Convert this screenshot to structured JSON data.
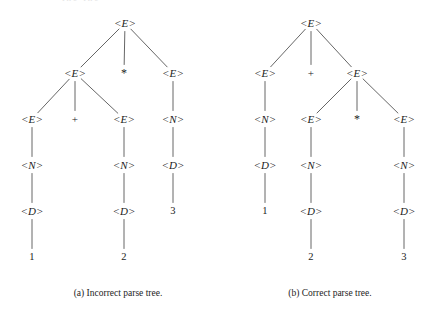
{
  "figure": {
    "width": 437,
    "height": 309,
    "background": "#ffffff",
    "ink_color": "#1c1c1c",
    "edge_color": "#555555",
    "partial_top_text": "the the"
  },
  "trees": [
    {
      "id": "incorrect-parse-tree",
      "caption": "(a) Incorrect parse tree.",
      "caption_x": 118,
      "caption_y": 288,
      "nodes": [
        {
          "id": "a-root",
          "label": "<E>",
          "kind": "nonterminal",
          "x": 125,
          "y": 23,
          "row": 0
        },
        {
          "id": "a-e1",
          "label": "<E>",
          "kind": "nonterminal",
          "x": 75,
          "y": 73,
          "row": 1
        },
        {
          "id": "a-star",
          "label": "*",
          "kind": "operator",
          "x": 124,
          "y": 73,
          "row": 1
        },
        {
          "id": "a-e2",
          "label": "<E>",
          "kind": "nonterminal",
          "x": 173,
          "y": 73,
          "row": 1
        },
        {
          "id": "a-e3",
          "label": "<E>",
          "kind": "nonterminal",
          "x": 32,
          "y": 119,
          "row": 2
        },
        {
          "id": "a-plus",
          "label": "+",
          "kind": "operator",
          "x": 75,
          "y": 119,
          "row": 2
        },
        {
          "id": "a-e4",
          "label": "<E>",
          "kind": "nonterminal",
          "x": 124,
          "y": 119,
          "row": 2
        },
        {
          "id": "a-n1",
          "label": "<N>",
          "kind": "nonterminal",
          "x": 173,
          "y": 119,
          "row": 2
        },
        {
          "id": "a-n2",
          "label": "<N>",
          "kind": "nonterminal",
          "x": 32,
          "y": 165,
          "row": 3
        },
        {
          "id": "a-n3",
          "label": "<N>",
          "kind": "nonterminal",
          "x": 124,
          "y": 165,
          "row": 3
        },
        {
          "id": "a-d1",
          "label": "<D>",
          "kind": "nonterminal",
          "x": 173,
          "y": 165,
          "row": 3
        },
        {
          "id": "a-d2",
          "label": "<D>",
          "kind": "nonterminal",
          "x": 32,
          "y": 211,
          "row": 4
        },
        {
          "id": "a-d3",
          "label": "<D>",
          "kind": "nonterminal",
          "x": 124,
          "y": 211,
          "row": 4
        },
        {
          "id": "a-t3",
          "label": "3",
          "kind": "terminal",
          "x": 173,
          "y": 211,
          "row": 4
        },
        {
          "id": "a-t1",
          "label": "1",
          "kind": "terminal",
          "x": 32,
          "y": 257,
          "row": 5
        },
        {
          "id": "a-t2",
          "label": "2",
          "kind": "terminal",
          "x": 124,
          "y": 257,
          "row": 5
        }
      ],
      "edges": [
        {
          "from": "a-root",
          "to": "a-e1"
        },
        {
          "from": "a-root",
          "to": "a-star"
        },
        {
          "from": "a-root",
          "to": "a-e2"
        },
        {
          "from": "a-e1",
          "to": "a-e3"
        },
        {
          "from": "a-e1",
          "to": "a-plus"
        },
        {
          "from": "a-e1",
          "to": "a-e4"
        },
        {
          "from": "a-e2",
          "to": "a-n1"
        },
        {
          "from": "a-e3",
          "to": "a-n2"
        },
        {
          "from": "a-e4",
          "to": "a-n3"
        },
        {
          "from": "a-n1",
          "to": "a-d1"
        },
        {
          "from": "a-n2",
          "to": "a-d2"
        },
        {
          "from": "a-n3",
          "to": "a-d3"
        },
        {
          "from": "a-d1",
          "to": "a-t3"
        },
        {
          "from": "a-d2",
          "to": "a-t1"
        },
        {
          "from": "a-d3",
          "to": "a-t2"
        }
      ]
    },
    {
      "id": "correct-parse-tree",
      "caption": "(b) Correct parse tree.",
      "caption_x": 330,
      "caption_y": 288,
      "nodes": [
        {
          "id": "b-root",
          "label": "<E>",
          "kind": "nonterminal",
          "x": 311,
          "y": 23,
          "row": 0
        },
        {
          "id": "b-e1",
          "label": "<E>",
          "kind": "nonterminal",
          "x": 265,
          "y": 73,
          "row": 1
        },
        {
          "id": "b-plus",
          "label": "+",
          "kind": "operator",
          "x": 311,
          "y": 73,
          "row": 1
        },
        {
          "id": "b-e2",
          "label": "<E>",
          "kind": "nonterminal",
          "x": 357,
          "y": 73,
          "row": 1
        },
        {
          "id": "b-n1",
          "label": "<N>",
          "kind": "nonterminal",
          "x": 265,
          "y": 119,
          "row": 2
        },
        {
          "id": "b-e3",
          "label": "<E>",
          "kind": "nonterminal",
          "x": 311,
          "y": 119,
          "row": 2
        },
        {
          "id": "b-star",
          "label": "*",
          "kind": "operator",
          "x": 357,
          "y": 119,
          "row": 2
        },
        {
          "id": "b-e4",
          "label": "<E>",
          "kind": "nonterminal",
          "x": 404,
          "y": 119,
          "row": 2
        },
        {
          "id": "b-d1",
          "label": "<D>",
          "kind": "nonterminal",
          "x": 265,
          "y": 165,
          "row": 3
        },
        {
          "id": "b-n2",
          "label": "<N>",
          "kind": "nonterminal",
          "x": 311,
          "y": 165,
          "row": 3
        },
        {
          "id": "b-n3",
          "label": "<N>",
          "kind": "nonterminal",
          "x": 404,
          "y": 165,
          "row": 3
        },
        {
          "id": "b-t1",
          "label": "1",
          "kind": "terminal",
          "x": 265,
          "y": 211,
          "row": 4
        },
        {
          "id": "b-d2",
          "label": "<D>",
          "kind": "nonterminal",
          "x": 311,
          "y": 211,
          "row": 4
        },
        {
          "id": "b-d3",
          "label": "<D>",
          "kind": "nonterminal",
          "x": 404,
          "y": 211,
          "row": 4
        },
        {
          "id": "b-t2",
          "label": "2",
          "kind": "terminal",
          "x": 311,
          "y": 257,
          "row": 5
        },
        {
          "id": "b-t3",
          "label": "3",
          "kind": "terminal",
          "x": 404,
          "y": 257,
          "row": 5
        }
      ],
      "edges": [
        {
          "from": "b-root",
          "to": "b-e1"
        },
        {
          "from": "b-root",
          "to": "b-plus"
        },
        {
          "from": "b-root",
          "to": "b-e2"
        },
        {
          "from": "b-e1",
          "to": "b-n1"
        },
        {
          "from": "b-e2",
          "to": "b-e3"
        },
        {
          "from": "b-e2",
          "to": "b-star"
        },
        {
          "from": "b-e2",
          "to": "b-e4"
        },
        {
          "from": "b-n1",
          "to": "b-d1"
        },
        {
          "from": "b-e3",
          "to": "b-n2"
        },
        {
          "from": "b-e4",
          "to": "b-n3"
        },
        {
          "from": "b-d1",
          "to": "b-t1"
        },
        {
          "from": "b-n2",
          "to": "b-d2"
        },
        {
          "from": "b-n3",
          "to": "b-d3"
        },
        {
          "from": "b-d2",
          "to": "b-t2"
        },
        {
          "from": "b-d3",
          "to": "b-t3"
        }
      ]
    }
  ]
}
